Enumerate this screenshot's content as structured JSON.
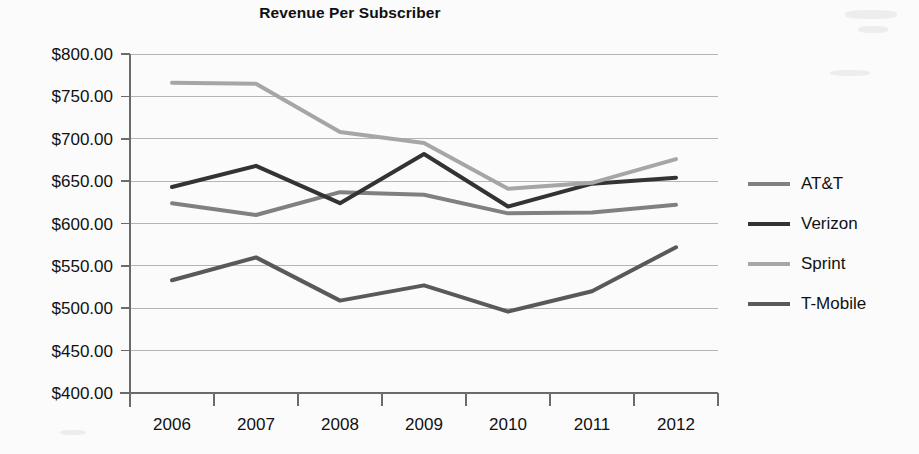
{
  "chart_data": {
    "type": "line",
    "title": "Revenue Per Subscriber",
    "xlabel": "",
    "ylabel": "",
    "categories": [
      "2006",
      "2007",
      "2008",
      "2009",
      "2010",
      "2011",
      "2012"
    ],
    "x_tick_labels": [
      "2006",
      "2007",
      "2008",
      "2009",
      "2010",
      "2011",
      "2012"
    ],
    "y_tick_labels": [
      "$400.00",
      "$450.00",
      "$500.00",
      "$550.00",
      "$600.00",
      "$650.00",
      "$700.00",
      "$750.00",
      "$800.00"
    ],
    "y_tick_values": [
      400,
      450,
      500,
      550,
      600,
      650,
      700,
      750,
      800
    ],
    "ylim": [
      400,
      800
    ],
    "grid": true,
    "legend_position": "right",
    "value_prefix": "$",
    "series": [
      {
        "name": "AT&T",
        "color": "#808080",
        "values": [
          624,
          610,
          637,
          634,
          612,
          613,
          622
        ]
      },
      {
        "name": "Verizon",
        "color": "#333333",
        "values": [
          643,
          668,
          624,
          682,
          620,
          647,
          654
        ]
      },
      {
        "name": "Sprint",
        "color": "#a6a6a6",
        "values": [
          766,
          765,
          708,
          695,
          641,
          648,
          676
        ]
      },
      {
        "name": "T-Mobile",
        "color": "#595959",
        "values": [
          533,
          560,
          509,
          527,
          496,
          520,
          572
        ]
      }
    ]
  },
  "legend": {
    "items": [
      {
        "label": "AT&T"
      },
      {
        "label": "Verizon"
      },
      {
        "label": "Sprint"
      },
      {
        "label": "T-Mobile"
      }
    ]
  },
  "colors": {
    "background": "#fbfbfb",
    "axis": "#6b6b6b",
    "gridline": "#b5b5b5",
    "text": "#111111"
  }
}
